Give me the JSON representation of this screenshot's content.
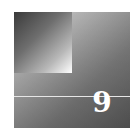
{
  "chapter_badge": {
    "number": "9",
    "colors": {
      "outer_light": "#d8d8d8",
      "outer_dark": "#5a5a5a",
      "inner_dark": "#3a3a3a",
      "inner_light": "#ffffff",
      "rule": "#e6e6e6",
      "number": "#ffffff"
    }
  }
}
